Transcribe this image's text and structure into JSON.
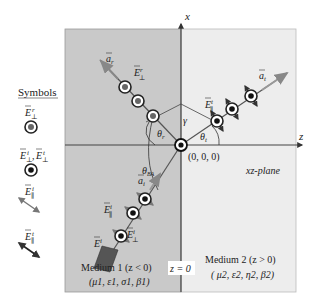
{
  "legend": {
    "title": "Symbols",
    "items": [
      {
        "label": "E⊥r",
        "symbol": "circle-gray-dot",
        "sup": "r",
        "sub": "⊥"
      },
      {
        "label": "E⊥i, E⊥t",
        "symbol": "circle-black-dot",
        "sup1": "i",
        "sup2": "t",
        "sub": "⊥"
      },
      {
        "label": "E∥i",
        "symbol": "double-arrow-gray",
        "sup": "i",
        "sub": "∥"
      },
      {
        "label": "E∥t",
        "symbol": "double-arrow-black",
        "sup": "t",
        "sub": "∥"
      }
    ]
  },
  "axes": {
    "x_label": "x",
    "z_label": "z",
    "origin_label": "(0, 0, 0)",
    "plane_label": "xz-plane",
    "interface_label": "z = 0"
  },
  "angles": {
    "theta_r": "θr",
    "theta_t": "θt",
    "theta_ba": "θBA",
    "gamma": "γ"
  },
  "vectors": {
    "a_r": "ar",
    "a_t": "at",
    "a_i": "ai",
    "E_perp_r": "E⊥r",
    "E_par_t": "E∥t",
    "E_par_i": "E∥i",
    "E_perp_i": "E⊥i",
    "E_i": "Ei"
  },
  "media": {
    "medium1": {
      "name": "Medium 1 (z < 0)",
      "params": "(μ1, ε1, σ1, β1)",
      "color": "#c9c9c9"
    },
    "medium2": {
      "name": "Medium 2 (z > 0)",
      "params": "( μ2, ε2, η2, β2)",
      "color": "#ededed"
    }
  }
}
